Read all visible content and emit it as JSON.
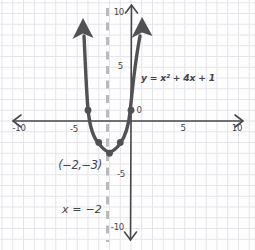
{
  "figure": {
    "background": "#fefefe",
    "grid_color": "#e5e5ea",
    "axis_color": "#47474a",
    "curve_color": "#515155",
    "dashed_line_color": "#b9babc",
    "text_color": "#454548"
  },
  "labels": {
    "equation": "y = x² + 4x + 1",
    "vertex": "(−2,−3)",
    "axis_of_symmetry": "x = −2",
    "origin": "0"
  },
  "axes": {
    "x_tick_labels": [
      "-10",
      "-5",
      "5",
      "10"
    ],
    "y_tick_labels": [
      "10",
      "5",
      "-5",
      "-10"
    ]
  },
  "chart_data": {
    "type": "line",
    "title": "",
    "equation": "y = x² + 4x + 1",
    "axis_of_symmetry": "x = -2",
    "vertex": [
      -2,
      -3
    ],
    "marked_points": [
      [
        -4,
        1
      ],
      [
        -3,
        -2
      ],
      [
        -2,
        -3
      ],
      [
        -1,
        -2
      ],
      [
        0,
        1
      ]
    ],
    "x_ticks": [
      -10,
      -5,
      0,
      5,
      10
    ],
    "y_ticks": [
      -10,
      -5,
      5,
      10
    ],
    "xlim": [
      -10,
      10
    ],
    "ylim": [
      -10,
      10
    ],
    "grid": true,
    "legend": false,
    "xlabel": "",
    "ylabel": ""
  }
}
